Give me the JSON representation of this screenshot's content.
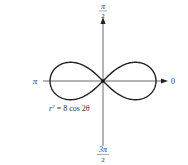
{
  "diagram": {
    "type": "polar-graph",
    "equation": "r² = 8 cos 2θ",
    "equation_parts": {
      "lhs": "r",
      "exp": "2",
      "rhs": " = 8 cos 2θ"
    },
    "axis_labels": {
      "top_num": "π",
      "top_den": "2",
      "bottom_num": "3π",
      "bottom_den": "2",
      "left": "π",
      "right": "0"
    },
    "curve": "lemniscate",
    "stroke_color": "#222222"
  }
}
